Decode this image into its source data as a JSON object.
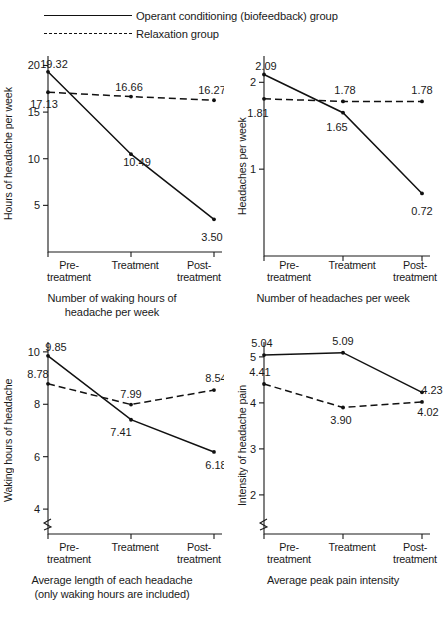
{
  "legend": {
    "entries": [
      {
        "label": "Operant conditioning (biofeedback) group",
        "style": "solid"
      },
      {
        "label": "Relaxation group",
        "style": "dashed"
      }
    ]
  },
  "categories": [
    "Pre-\ntreatment",
    "Treatment",
    "Post-\ntreatment"
  ],
  "category_line1": [
    "Pre-",
    "Treatment",
    "Post-"
  ],
  "category_line2": [
    "treatment",
    "",
    "treatment"
  ],
  "chart_data": [
    {
      "id": "hours-per-week",
      "type": "line",
      "title": "",
      "caption_line1": "Number of waking hours of",
      "caption_line2": "headache per week",
      "xlabel": "",
      "ylabel": "Hours of headache per week",
      "categories": [
        "Pre-treatment",
        "Treatment",
        "Post-treatment"
      ],
      "yticks": [
        5,
        10,
        15,
        20
      ],
      "ytick_labels": [
        "5",
        "10",
        "15",
        "20"
      ],
      "ylim": [
        0,
        20
      ],
      "grid": false,
      "legend_position": "top",
      "axis_break": false,
      "series": [
        {
          "name": "Operant conditioning (biofeedback) group",
          "style": "solid",
          "values": [
            19.32,
            10.49,
            3.5
          ],
          "labels": [
            "19.32",
            "10.49",
            "3.50"
          ]
        },
        {
          "name": "Relaxation group",
          "style": "dashed",
          "values": [
            17.13,
            16.66,
            16.27
          ],
          "labels": [
            "17.13",
            "16.66",
            "16.27"
          ]
        }
      ]
    },
    {
      "id": "headaches-per-week",
      "type": "line",
      "title": "",
      "caption_line1": "Number of headaches per week",
      "caption_line2": "",
      "xlabel": "",
      "ylabel": "Headaches per week",
      "categories": [
        "Pre-treatment",
        "Treatment",
        "Post-treatment"
      ],
      "yticks": [
        1,
        2
      ],
      "ytick_labels": [
        "1",
        "2"
      ],
      "ylim": [
        0,
        2.2
      ],
      "grid": false,
      "axis_break": false,
      "series": [
        {
          "name": "Operant conditioning (biofeedback) group",
          "style": "solid",
          "values": [
            2.09,
            1.65,
            0.72
          ],
          "labels": [
            "2.09",
            "1.65",
            "0.72"
          ]
        },
        {
          "name": "Relaxation group",
          "style": "dashed",
          "values": [
            1.81,
            1.78,
            1.78
          ],
          "labels": [
            "1.81",
            "1.78",
            "1.78"
          ]
        }
      ]
    },
    {
      "id": "waking-hours-each-headache",
      "type": "line",
      "title": "",
      "caption_line1": "Average length of each headache",
      "caption_line2": "(only waking hours are included)",
      "xlabel": "",
      "ylabel": "Waking hours of headache",
      "categories": [
        "Pre-treatment",
        "Treatment",
        "Post-treatment"
      ],
      "yticks": [
        4,
        6,
        8,
        10
      ],
      "ytick_labels": [
        "4",
        "6",
        "8",
        "10"
      ],
      "ylim": [
        3.2,
        10
      ],
      "grid": false,
      "axis_break": true,
      "series": [
        {
          "name": "Operant conditioning (biofeedback) group",
          "style": "solid",
          "values": [
            9.85,
            7.41,
            6.18
          ],
          "labels": [
            "9.85",
            "7.41",
            "6.18"
          ]
        },
        {
          "name": "Relaxation group",
          "style": "dashed",
          "values": [
            8.78,
            7.99,
            8.54
          ],
          "labels": [
            "8.78",
            "7.99",
            "8.54"
          ]
        }
      ]
    },
    {
      "id": "peak-pain-intensity",
      "type": "line",
      "title": "",
      "caption_line1": "Average peak pain intensity",
      "caption_line2": "",
      "xlabel": "",
      "ylabel": "Intensity of headache pain",
      "categories": [
        "Pre-treatment",
        "Treatment",
        "Post-treatment"
      ],
      "yticks": [
        2,
        3,
        4,
        5
      ],
      "ytick_labels": [
        "2",
        "3",
        "4",
        "5"
      ],
      "ylim": [
        1.3,
        5.2
      ],
      "grid": false,
      "axis_break": true,
      "series": [
        {
          "name": "Operant conditioning (biofeedback) group",
          "style": "solid",
          "values": [
            5.04,
            5.09,
            4.23
          ],
          "labels": [
            "5.04",
            "5.09",
            "4.23"
          ]
        },
        {
          "name": "Relaxation group",
          "style": "dashed",
          "values": [
            4.41,
            3.9,
            4.02
          ],
          "labels": [
            "4.41",
            "3.90",
            "4.02"
          ]
        }
      ]
    }
  ]
}
